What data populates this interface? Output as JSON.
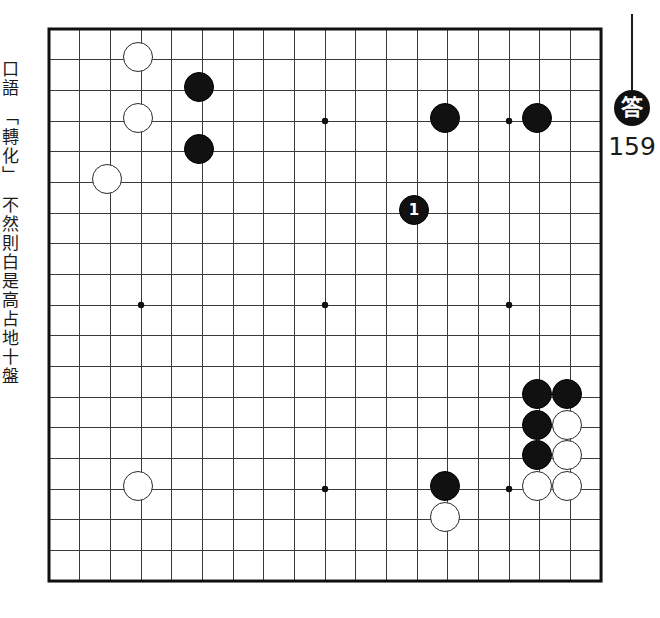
{
  "page": {
    "background_color": "#ffffff"
  },
  "side_caption": {
    "text": "口語　「轉化」　不然則白是高占地十盤"
  },
  "answer": {
    "badge_label": "答",
    "number": "159",
    "stem_color": "#1b1b1b",
    "badge_bg": "#111111",
    "badge_fg": "#ffffff"
  },
  "board": {
    "size": 19,
    "origin_x": 46,
    "origin_y": 26,
    "spacing": 30.67,
    "line_color": "#3a3a3a",
    "border_color": "#111111",
    "line_width": 1,
    "border_width": 3,
    "background": "#ffffff",
    "stone_radius": 15,
    "star_radius": 3.2,
    "star_points": [
      [
        3,
        3
      ],
      [
        3,
        9
      ],
      [
        3,
        15
      ],
      [
        9,
        3
      ],
      [
        9,
        9
      ],
      [
        9,
        15
      ],
      [
        15,
        3
      ],
      [
        15,
        9
      ],
      [
        15,
        15
      ]
    ]
  },
  "stones": [
    {
      "color": "white",
      "col": 3,
      "row": 1,
      "label": ""
    },
    {
      "color": "black",
      "col": 5,
      "row": 2,
      "label": ""
    },
    {
      "color": "white",
      "col": 3,
      "row": 3,
      "label": ""
    },
    {
      "color": "black",
      "col": 13,
      "row": 3,
      "label": ""
    },
    {
      "color": "black",
      "col": 16,
      "row": 3,
      "label": ""
    },
    {
      "color": "black",
      "col": 5,
      "row": 4,
      "label": ""
    },
    {
      "color": "white",
      "col": 2,
      "row": 5,
      "label": ""
    },
    {
      "color": "black",
      "col": 12,
      "row": 6,
      "label": "1"
    },
    {
      "color": "black",
      "col": 16,
      "row": 12,
      "label": ""
    },
    {
      "color": "black",
      "col": 17,
      "row": 12,
      "label": ""
    },
    {
      "color": "black",
      "col": 16,
      "row": 13,
      "label": ""
    },
    {
      "color": "white",
      "col": 17,
      "row": 13,
      "label": ""
    },
    {
      "color": "white",
      "col": 3,
      "row": 15,
      "label": ""
    },
    {
      "color": "black",
      "col": 13,
      "row": 15,
      "label": ""
    },
    {
      "color": "black",
      "col": 16,
      "row": 14,
      "label": ""
    },
    {
      "color": "white",
      "col": 17,
      "row": 14,
      "label": ""
    },
    {
      "color": "white",
      "col": 16,
      "row": 15,
      "label": ""
    },
    {
      "color": "white",
      "col": 17,
      "row": 15,
      "label": ""
    },
    {
      "color": "white",
      "col": 13,
      "row": 16,
      "label": ""
    }
  ]
}
